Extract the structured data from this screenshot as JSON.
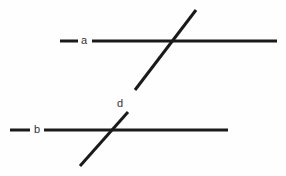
{
  "figure": {
    "width": 286,
    "height": 176,
    "background_color": "#fefefe",
    "stroke_color": "#1a1a1a",
    "label_color": "#333333"
  },
  "labels": {
    "line_a": "a",
    "line_b": "b",
    "line_d": "d"
  },
  "chart_data": {
    "type": "diagram",
    "elements": [
      {
        "name": "line-a-tick",
        "kind": "segment",
        "label": "a",
        "x1": 60,
        "y1": 41,
        "x2": 78,
        "y2": 41,
        "stroke_width": 3
      },
      {
        "name": "line-a-main",
        "kind": "segment",
        "label": "a",
        "x1": 92,
        "y1": 41,
        "x2": 277,
        "y2": 41,
        "stroke_width": 3
      },
      {
        "name": "line-b-tick",
        "kind": "segment",
        "label": "b",
        "x1": 10,
        "y1": 130,
        "x2": 30,
        "y2": 130,
        "stroke_width": 3
      },
      {
        "name": "line-b-main",
        "kind": "segment",
        "label": "b",
        "x1": 44,
        "y1": 130,
        "x2": 228,
        "y2": 130,
        "stroke_width": 3
      },
      {
        "name": "line-d-upper",
        "kind": "segment",
        "label": "d",
        "x1": 196,
        "y1": 10,
        "x2": 135,
        "y2": 90,
        "stroke_width": 3
      },
      {
        "name": "line-d-lower",
        "kind": "segment",
        "label": "d",
        "x1": 128,
        "y1": 112,
        "x2": 80,
        "y2": 166,
        "stroke_width": 3
      }
    ],
    "label_positions": [
      {
        "text": "a",
        "x": 84,
        "y": 41
      },
      {
        "text": "b",
        "x": 37,
        "y": 130
      },
      {
        "text": "d",
        "x": 124,
        "y": 104
      }
    ],
    "relationships": [
      "line a is parallel to line b",
      "line d is a transversal crossing both a and b"
    ],
    "intersections": [
      {
        "lines": [
          "a",
          "d"
        ],
        "x": 172,
        "y": 41
      },
      {
        "lines": [
          "b",
          "d"
        ],
        "x": 105,
        "y": 130
      }
    ]
  }
}
